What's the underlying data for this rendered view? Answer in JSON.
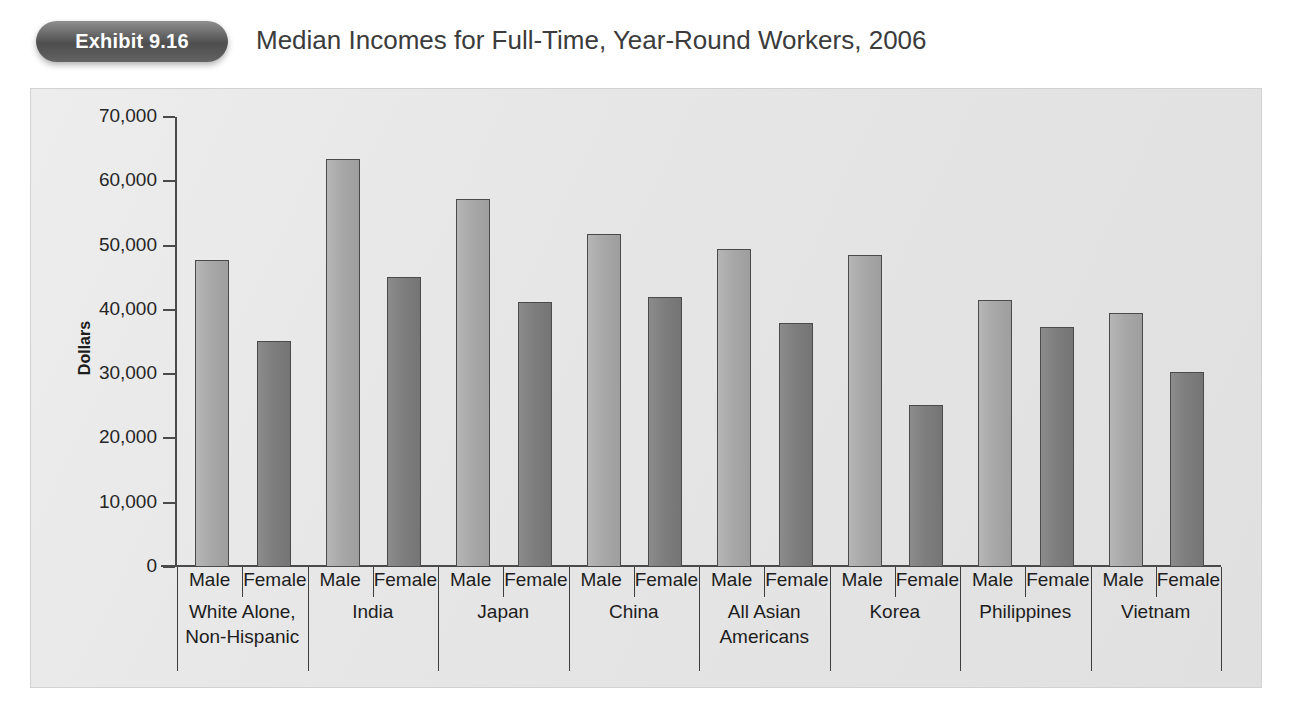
{
  "header": {
    "exhibit_badge": "Exhibit 9.16",
    "title": "Median Incomes for Full-Time, Year-Round Workers, 2006"
  },
  "chart_data": {
    "type": "bar",
    "title": "Median Incomes for Full-Time, Year-Round Workers, 2006",
    "xlabel": "",
    "ylabel": "Dollars",
    "ylim": [
      0,
      70000
    ],
    "ytick_labels": [
      "70,000",
      "60,000",
      "50,000",
      "40,000",
      "30,000",
      "20,000",
      "10,000",
      "0"
    ],
    "ytick_values": [
      70000,
      60000,
      50000,
      40000,
      30000,
      20000,
      10000,
      0
    ],
    "grid": false,
    "legend": "none",
    "categories": [
      "White Alone, Non-Hispanic",
      "India",
      "Japan",
      "China",
      "All Asian Americans",
      "Korea",
      "Philippines",
      "Vietnam"
    ],
    "series": [
      {
        "name": "Male",
        "color": "#a8a8a8",
        "values": [
          47800,
          63400,
          57200,
          51800,
          49400,
          48600,
          41500,
          39500
        ]
      },
      {
        "name": "Female",
        "color": "#7e7e7e",
        "values": [
          35200,
          45100,
          41200,
          42000,
          38000,
          25200,
          37300,
          30400
        ]
      }
    ],
    "groups": [
      {
        "label_lines": [
          "White Alone,",
          "Non-Hispanic"
        ],
        "bars": [
          {
            "gender": "Male",
            "value": 47800
          },
          {
            "gender": "Female",
            "value": 35200
          }
        ]
      },
      {
        "label_lines": [
          "India"
        ],
        "bars": [
          {
            "gender": "Male",
            "value": 63400
          },
          {
            "gender": "Female",
            "value": 45100
          }
        ]
      },
      {
        "label_lines": [
          "Japan"
        ],
        "bars": [
          {
            "gender": "Male",
            "value": 57200
          },
          {
            "gender": "Female",
            "value": 41200
          }
        ]
      },
      {
        "label_lines": [
          "China"
        ],
        "bars": [
          {
            "gender": "Male",
            "value": 51800
          },
          {
            "gender": "Female",
            "value": 42000
          }
        ]
      },
      {
        "label_lines": [
          "All Asian",
          "Americans"
        ],
        "bars": [
          {
            "gender": "Male",
            "value": 49400
          },
          {
            "gender": "Female",
            "value": 38000
          }
        ]
      },
      {
        "label_lines": [
          "Korea"
        ],
        "bars": [
          {
            "gender": "Male",
            "value": 48600
          },
          {
            "gender": "Female",
            "value": 25200
          }
        ]
      },
      {
        "label_lines": [
          "Philippines"
        ],
        "bars": [
          {
            "gender": "Male",
            "value": 41500
          },
          {
            "gender": "Female",
            "value": 37300
          }
        ]
      },
      {
        "label_lines": [
          "Vietnam"
        ],
        "bars": [
          {
            "gender": "Male",
            "value": 39500
          },
          {
            "gender": "Female",
            "value": 30400
          }
        ]
      }
    ]
  },
  "colors": {
    "male_bar": "#a8a8a8",
    "female_bar": "#7e7e7e",
    "axis": "#4a4a4a",
    "panel_background": "#e6e6e6",
    "badge_background": "#5a5a5a",
    "title_text": "#3b3b3b"
  }
}
